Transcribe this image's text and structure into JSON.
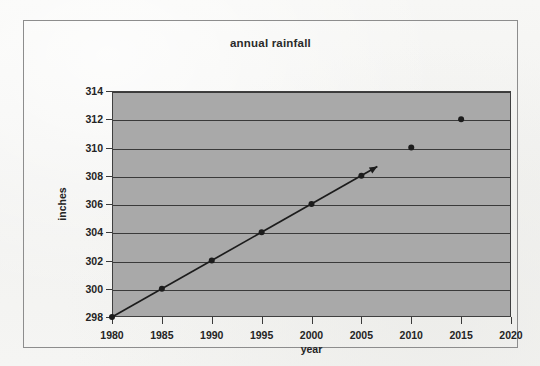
{
  "chart_data": {
    "type": "line",
    "title": "annual rainfall",
    "xlabel": "year",
    "ylabel": "inches",
    "xlim": [
      1980,
      2020
    ],
    "ylim": [
      298,
      314
    ],
    "xticks": [
      1980,
      1985,
      1990,
      1995,
      2000,
      2005,
      2010,
      2015,
      2020
    ],
    "yticks": [
      298,
      300,
      302,
      304,
      306,
      308,
      310,
      312,
      314
    ],
    "grid": "horizontal",
    "legend": null,
    "plot_background_color": "#a9a9a9",
    "line_color": "#1c1c1c",
    "marker_color": "#1c1c1c",
    "series": [
      {
        "name": "trend-line",
        "style": "line-with-markers-and-arrow",
        "x": [
          1980,
          1985,
          1990,
          1995,
          2000,
          2005
        ],
        "values": [
          298,
          300,
          302,
          304,
          306,
          308
        ],
        "arrow_end": {
          "x": 2006.6,
          "y": 308.65
        }
      },
      {
        "name": "later-points",
        "style": "markers-only",
        "x": [
          2010,
          2015
        ],
        "values": [
          310,
          312
        ]
      }
    ]
  },
  "figure": {
    "title": "annual rainfall",
    "x_axis_title": "year",
    "y_axis_title": "inches",
    "x_tick_labels": [
      "1980",
      "1985",
      "1990",
      "1995",
      "2000",
      "2005",
      "2010",
      "2015",
      "2020"
    ],
    "y_tick_labels": [
      "298",
      "300",
      "302",
      "304",
      "306",
      "308",
      "310",
      "312",
      "314"
    ]
  }
}
